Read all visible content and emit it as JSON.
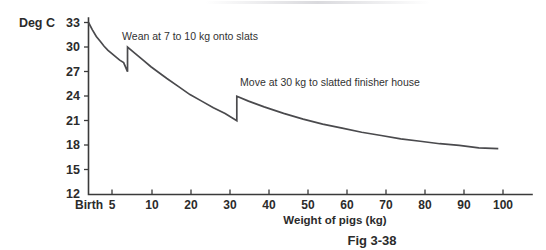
{
  "figure": {
    "caption": "Fig 3-38",
    "unit_label": "Deg C"
  },
  "chart_data": {
    "type": "line",
    "title": "",
    "subtitle": "",
    "xlabel": "Weight of pigs (kg)",
    "ylabel": "Deg C",
    "ylim": [
      12,
      33
    ],
    "xlim": [
      0,
      108
    ],
    "grid": false,
    "legend": "none",
    "y_ticks": [
      12,
      15,
      18,
      21,
      24,
      27,
      30,
      33
    ],
    "x_ticks": [
      "Birth",
      "5",
      "10",
      "20",
      "30",
      "40",
      "50",
      "60",
      "70",
      "80",
      "90",
      "100"
    ],
    "x_tick_values": [
      0,
      5,
      10,
      20,
      30,
      40,
      50,
      60,
      70,
      80,
      90,
      100
    ],
    "series": [
      {
        "name": "Recommended temperature",
        "x": [
          0,
          1,
          2,
          3,
          4,
          5,
          6,
          7,
          8,
          9,
          10,
          10,
          12,
          14,
          16,
          18,
          20,
          23,
          26,
          29,
          32,
          35,
          38,
          38,
          41,
          45,
          50,
          55,
          60,
          65,
          70,
          75,
          80,
          85,
          90,
          95,
          100,
          105
        ],
        "values": [
          33.0,
          32.1,
          31.3,
          30.7,
          30.1,
          29.6,
          29.2,
          28.8,
          28.4,
          28.1,
          27.0,
          30.0,
          29.2,
          28.4,
          27.6,
          26.9,
          26.2,
          25.2,
          24.2,
          23.4,
          22.6,
          21.9,
          21.0,
          24.0,
          23.4,
          22.7,
          21.9,
          21.2,
          20.6,
          20.1,
          19.6,
          19.2,
          18.8,
          18.5,
          18.2,
          18.0,
          17.7,
          17.6
        ]
      }
    ],
    "annotations": [
      {
        "text": "Wean at 7 to 10 kg onto slats",
        "x_kg": 10,
        "y_deg": 31.5
      },
      {
        "text": "Move at 30 kg to slatted finisher house",
        "x_kg": 38,
        "y_deg": 25.5
      }
    ],
    "step_events": [
      {
        "label": "Wean at 7 to 10 kg onto slats",
        "x_kg": 10,
        "from_deg": 27.0,
        "to_deg": 30.0
      },
      {
        "label": "Move at 30 kg to slatted finisher house",
        "x_kg": 38,
        "from_deg": 21.0,
        "to_deg": 24.0
      }
    ],
    "colors": {
      "curve": "#4a4a4d",
      "axis": "#3a3a3a",
      "text": "#2b2b2b"
    }
  }
}
